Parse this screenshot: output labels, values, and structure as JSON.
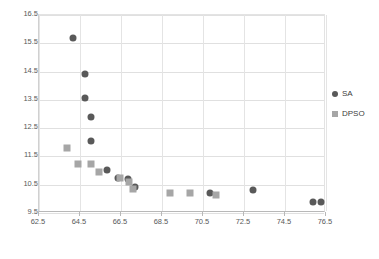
{
  "chart_data": {
    "type": "scatter",
    "title": "",
    "xlabel": "",
    "ylabel": "",
    "xlim": [
      62.5,
      76.5
    ],
    "ylim": [
      9.5,
      16.5
    ],
    "xticks": [
      62.5,
      64.5,
      66.5,
      68.5,
      70.5,
      72.5,
      74.5,
      76.5
    ],
    "yticks": [
      9.5,
      10.5,
      11.5,
      12.5,
      13.5,
      14.5,
      15.5,
      16.5
    ],
    "xtick_labels": [
      "62.5",
      "64.5",
      "66.5",
      "68.5",
      "70.5",
      "72.5",
      "74.5",
      "76.5"
    ],
    "ytick_labels": [
      "9.5",
      "10.5",
      "11.5",
      "12.5",
      "13.5",
      "14.5",
      "15.5",
      "16.5"
    ],
    "grid": true,
    "grid_axes": "both",
    "legend_position": "right",
    "series": [
      {
        "name": "SA",
        "marker": "circle",
        "color": "#595959",
        "points": [
          [
            64.15,
            15.67
          ],
          [
            64.75,
            14.41
          ],
          [
            64.75,
            13.57
          ],
          [
            65.05,
            12.88
          ],
          [
            65.05,
            12.03
          ],
          [
            65.8,
            11.03
          ],
          [
            66.35,
            10.72
          ],
          [
            66.85,
            10.7
          ],
          [
            67.2,
            10.42
          ],
          [
            70.85,
            10.22
          ],
          [
            72.95,
            10.3
          ],
          [
            75.85,
            9.9
          ],
          [
            76.25,
            9.9
          ]
        ]
      },
      {
        "name": "DPSO",
        "marker": "square",
        "color": "#a6a6a6",
        "points": [
          [
            63.85,
            11.8
          ],
          [
            64.4,
            11.25
          ],
          [
            65.05,
            11.22
          ],
          [
            65.45,
            10.95
          ],
          [
            66.45,
            10.72
          ],
          [
            66.9,
            10.6
          ],
          [
            67.1,
            10.35
          ],
          [
            68.9,
            10.2
          ],
          [
            69.85,
            10.2
          ],
          [
            71.15,
            10.15
          ]
        ]
      }
    ]
  },
  "legend": {
    "entries": [
      {
        "label": "SA",
        "icon": "circle-marker-icon"
      },
      {
        "label": "DPSO",
        "icon": "square-marker-icon"
      }
    ]
  },
  "colors": {
    "sa": "#595959",
    "dpso": "#a6a6a6",
    "grid": "#e0e0e0",
    "axis": "#b8b8b8",
    "text": "#595959",
    "background": "#ffffff"
  }
}
